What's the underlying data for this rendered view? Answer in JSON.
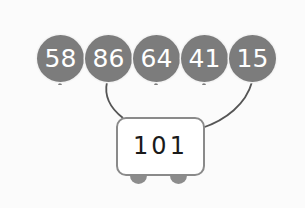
{
  "balloons": [
    {
      "value": "58",
      "cx": 60,
      "connected": false
    },
    {
      "value": "86",
      "cx": 108,
      "connected": true
    },
    {
      "value": "64",
      "cx": 156,
      "connected": false
    },
    {
      "value": "41",
      "cx": 204,
      "connected": false
    },
    {
      "value": "15",
      "cx": 252,
      "connected": true
    }
  ],
  "cart": {
    "total": "101"
  },
  "colors": {
    "balloon_fill": "#7c7c7c",
    "balloon_text": "#ffffff",
    "string": "#555555",
    "cart_border": "#8a8a8a",
    "cart_fill": "#ffffff",
    "wheel": "#8c8c8c",
    "background": "#fbfbfb"
  }
}
